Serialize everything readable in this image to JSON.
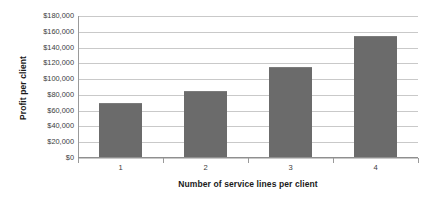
{
  "chart_data": {
    "type": "bar",
    "title": "",
    "categories": [
      "1",
      "2",
      "3",
      "4"
    ],
    "values": [
      70000,
      85000,
      115000,
      155000
    ],
    "series": [
      {
        "name": "Profit per client",
        "values": [
          70000,
          85000,
          115000,
          155000
        ]
      }
    ],
    "xlabel": "Number of service lines per client",
    "ylabel": "Profit per client",
    "ylim": [
      0,
      180000
    ],
    "ytick_step": 20000,
    "ytick_labels": [
      "$180,000",
      "$160,000",
      "$140,000",
      "$120,000",
      "$100,000",
      "$80,000",
      "$60,000",
      "$40,000",
      "$20,000",
      "$0"
    ],
    "ytick_values": [
      180000,
      160000,
      140000,
      120000,
      100000,
      80000,
      60000,
      40000,
      20000,
      0
    ],
    "grid": true,
    "legend": false,
    "legend_position": "none",
    "bar_color": "#6b6b6b",
    "grid_color": "#c9c9c9",
    "axis_color": "#8f8f8f",
    "background_color": "#ffffff"
  }
}
